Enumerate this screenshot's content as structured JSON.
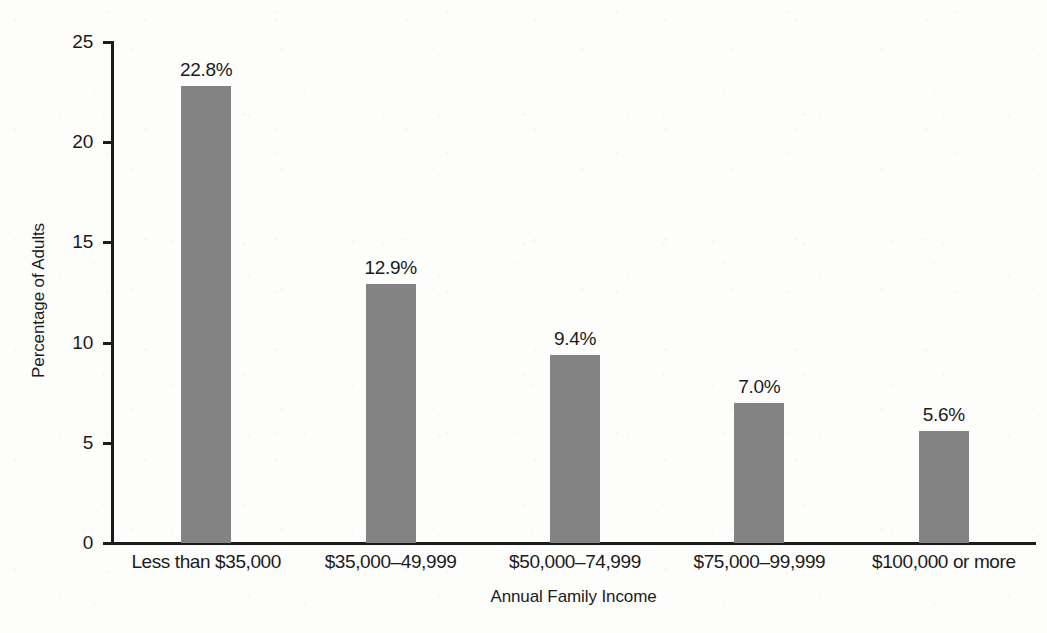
{
  "chart_data": {
    "type": "bar",
    "title": "",
    "subtitle": "",
    "xlabel": "Annual Family Income",
    "ylabel": "Percentage of Adults",
    "categories": [
      "Less than $35,000",
      "$35,000–49,999",
      "$50,000–74,999",
      "$75,000–99,999",
      "$100,000 or more"
    ],
    "values": [
      22.8,
      12.9,
      9.4,
      7.0,
      5.6
    ],
    "data_labels": [
      "22.8%",
      "12.9%",
      "9.4%",
      "7.0%",
      "5.6%"
    ],
    "ylim": [
      0,
      25
    ],
    "yticks": [
      0,
      5,
      10,
      15,
      20,
      25
    ],
    "ytick_labels": [
      "0",
      "5",
      "10",
      "15",
      "20",
      "25"
    ],
    "xlim_note": "categorical",
    "grid": false,
    "legend": false,
    "legend_position": "none",
    "bar_color": "#838383",
    "axis_color": "#1b1b1b",
    "background_color": "#fdfdfc"
  }
}
